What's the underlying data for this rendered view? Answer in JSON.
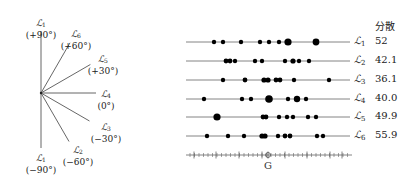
{
  "fan": {
    "center": [
      41,
      93
    ],
    "rays": [
      {
        "name": "L1",
        "sub": "1",
        "angle": "(+90°)",
        "deg": 90,
        "len": 62,
        "lx": 41,
        "ly": 18
      },
      {
        "name": "L6",
        "sub": "6",
        "angle": "(+60°)",
        "deg": 60,
        "len": 58,
        "lx": 76,
        "ly": 29
      },
      {
        "name": "L5",
        "sub": "5",
        "angle": "(+30°)",
        "deg": 30,
        "len": 57,
        "lx": 103,
        "ly": 54
      },
      {
        "name": "L4",
        "sub": "4",
        "angle": "(0°)",
        "deg": 0,
        "len": 55,
        "lx": 106,
        "ly": 89
      },
      {
        "name": "L3",
        "sub": "3",
        "angle": "(−30°)",
        "deg": -30,
        "len": 56,
        "lx": 106,
        "ly": 122
      },
      {
        "name": "L2",
        "sub": "2",
        "angle": "(−60°)",
        "deg": -60,
        "len": 56,
        "lx": 78,
        "ly": 145
      },
      {
        "name": "L1",
        "sub": "1",
        "angle": "(−90°)",
        "deg": -90,
        "len": 55,
        "lx": 41,
        "ly": 153
      }
    ]
  },
  "header": "分散",
  "rows": [
    {
      "label": "L",
      "sub": "1",
      "value": "52",
      "y": 42,
      "dots": [
        [
          214,
          2.2
        ],
        [
          223,
          2.2
        ],
        [
          241,
          2.2
        ],
        [
          260,
          2.2
        ],
        [
          269,
          2.2
        ],
        [
          279,
          2.2
        ],
        [
          288,
          3.6
        ],
        [
          316,
          3.4
        ]
      ]
    },
    {
      "label": "L",
      "sub": "2",
      "value": "42.1",
      "y": 61,
      "dots": [
        [
          226,
          2.4
        ],
        [
          230,
          2.4
        ],
        [
          235,
          2.2
        ],
        [
          255,
          2.2
        ],
        [
          262,
          2.2
        ],
        [
          285,
          2.2
        ],
        [
          293,
          2.6
        ],
        [
          299,
          2.2
        ],
        [
          309,
          2.2
        ]
      ]
    },
    {
      "label": "L",
      "sub": "3",
      "value": "36.1",
      "y": 80,
      "dots": [
        [
          223,
          2.2
        ],
        [
          245,
          2.4
        ],
        [
          264,
          2.6
        ],
        [
          268,
          2.6
        ],
        [
          276,
          2.4
        ],
        [
          280,
          2.4
        ],
        [
          294,
          2.2
        ],
        [
          329,
          2.2
        ]
      ]
    },
    {
      "label": "L",
      "sub": "4",
      "value": "40.0",
      "y": 99,
      "dots": [
        [
          204,
          2.2
        ],
        [
          242,
          2.2
        ],
        [
          251,
          2.2
        ],
        [
          269,
          3.8
        ],
        [
          288,
          2.2
        ],
        [
          297,
          3.2
        ],
        [
          306,
          2.2
        ]
      ]
    },
    {
      "label": "L",
      "sub": "5",
      "value": "49.9",
      "y": 117,
      "dots": [
        [
          217,
          3.6
        ],
        [
          263,
          2.4
        ],
        [
          266,
          2.4
        ],
        [
          279,
          2.2
        ],
        [
          287,
          2.2
        ],
        [
          293,
          2.2
        ],
        [
          308,
          2.2
        ],
        [
          316,
          2.2
        ]
      ]
    },
    {
      "label": "L",
      "sub": "6",
      "value": "55.9",
      "y": 136,
      "dots": [
        [
          207,
          2.2
        ],
        [
          228,
          2.2
        ],
        [
          244,
          2.2
        ],
        [
          262,
          2.6
        ],
        [
          265,
          2.6
        ],
        [
          278,
          2.2
        ],
        [
          285,
          2.4
        ],
        [
          290,
          2.4
        ],
        [
          317,
          2.2
        ],
        [
          323,
          2.2
        ]
      ]
    }
  ],
  "axis": {
    "y": 155,
    "x0": 186,
    "x1": 352,
    "center": 268,
    "center_label": "G",
    "major": [
      194,
      216,
      239,
      262,
      285,
      307,
      330,
      342
    ],
    "minor_step": 4.5
  },
  "lines": {
    "x0": 186,
    "x1": 350
  }
}
